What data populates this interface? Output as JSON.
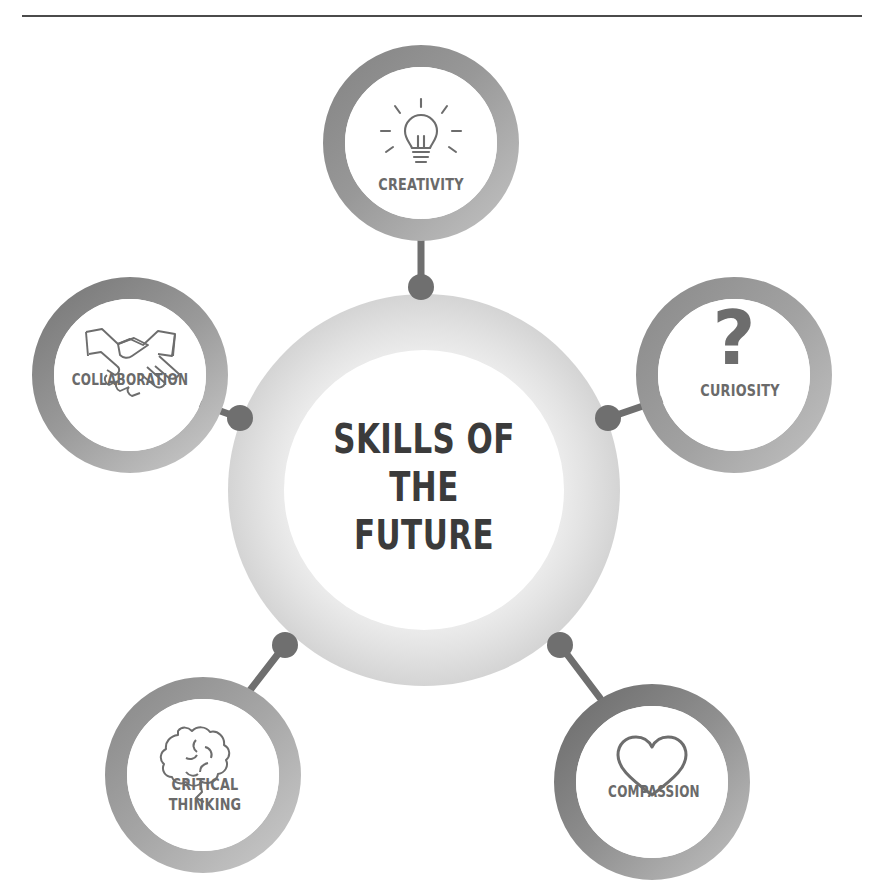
{
  "page": {
    "background_color": "#ffffff",
    "rule_color": "#4b4b4b"
  },
  "hub": {
    "line1": "SKILLS OF",
    "line2": "THE",
    "line3": "FUTURE",
    "ring_color_outer": "#d6d6d6",
    "ring_color_inner": "#efefef",
    "center_fill": "#ffffff",
    "text_color": "#3b3b3b"
  },
  "connector": {
    "dot_color": "#6f6f6f",
    "line_color": "#6f6f6f"
  },
  "nodes": [
    {
      "id": "creativity",
      "label": "CREATIVITY",
      "icon": "lightbulb-icon",
      "position": "top",
      "ring_gradient_from": "#8a8a8a",
      "ring_gradient_to": "#b9b9b9",
      "label_color": "#6a6a6a"
    },
    {
      "id": "collaboration",
      "label": "COLLABORATION",
      "icon": "handshake-icon",
      "position": "left-upper",
      "ring_gradient_from": "#7e7e7e",
      "ring_gradient_to": "#bdbdbd",
      "label_color": "#6a6a6a"
    },
    {
      "id": "curiosity",
      "label": "CURIOSITY",
      "icon": "question-mark-icon",
      "position": "right-upper",
      "ring_gradient_from": "#8e8e8e",
      "ring_gradient_to": "#b3b3b3",
      "label_color": "#6a6a6a"
    },
    {
      "id": "critical-thinking",
      "label": "CRITICAL\nTHINKING",
      "icon": "brain-icon",
      "position": "left-lower",
      "ring_gradient_from": "#8b8b8b",
      "ring_gradient_to": "#c2c2c2",
      "label_color": "#6a6a6a"
    },
    {
      "id": "compassion",
      "label": "COMPASSION",
      "icon": "heart-icon",
      "position": "right-lower",
      "ring_gradient_from": "#6e6e6e",
      "ring_gradient_to": "#b7b7b7",
      "label_color": "#6a6a6a"
    }
  ]
}
